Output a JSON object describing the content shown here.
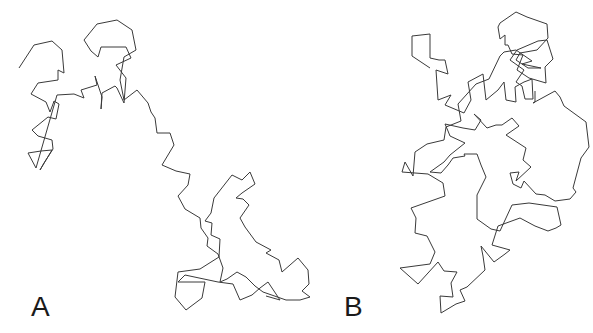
{
  "figure": {
    "panels": [
      {
        "label": "A",
        "description": "Protein C-alpha backbone trace, extended conformation"
      },
      {
        "label": "B",
        "description": "Protein C-alpha backbone trace, compact conformation"
      }
    ],
    "line_color": "#3a3a3a",
    "background": "#ffffff"
  },
  "traces": {
    "A": "19,68 34,45 52,41 62,50 64,73 58,70 58,80 38,83 31,94 46,102 50,112 53,104 54,101 59,104 56,119 48,117 32,130 38,136 52,140 53,149 44,163 40,170 52,150 41,151 28,153 36,168 57,95 74,94 84,98 81,90 97,85 95,76 102,97 101,109 102,93 115,86 117,88 124,103 126,78 116,65 131,58 126,47 101,47 98,57 91,51 84,40 97,24 117,20 132,30 136,50 124,57 120,80 124,100 137,90 148,103 151,112 155,118 157,133 170,133 174,145 162,165 176,171 190,174 188,185 178,196 185,209 200,218 201,228 208,238 207,246 218,254 223,268 220,282 227,279 237,272 246,277 255,286 263,292 286,300 300,300 310,297 302,291 309,284 308,270 298,258 282,272 279,260 266,253 271,250 256,242 245,227 240,218 249,205 243,199 236,198 242,193 255,184 250,172 242,180 232,175 214,198 211,213 205,221 212,223 211,235 220,239 219,257 200,269 178,272 175,297 186,310 202,298 205,282 178,282 185,275 218,282 233,284 240,300 252,295 260,288 268,282 280,300 266,296",
    "B": "430,68 412,56 412,36 430,34 430,58 439,60 445,60 448,74 436,70 438,100 451,95 445,105 464,113 471,100 468,82 483,74 486,100 498,90 504,82 506,100 516,102 515,87 524,82 532,79 533,99 525,99 522,86 516,82 524,70 510,60 517,50 538,41 547,40 553,59 545,67 546,83 529,78 517,70 523,55 512,54 508,45 505,45 505,35 500,39 498,27 500,23 516,12 527,17 547,24 548,38 537,50 520,53 516,60 528,68 541,68 522,64 532,61 516,50 504,52 500,56 489,79 476,84 458,104 461,121 446,127 444,140 427,144 415,152 413,176 405,162 402,172 428,174 443,183 445,196 411,208 416,218 415,233 427,236 435,252 430,264 400,268 418,284 438,262 444,271 457,272 451,283 453,297 440,296 441,313 456,304 465,301 460,290 467,287 485,270 483,256 481,246 494,262 505,254 510,250 492,245 498,226 520,218 535,226 548,231 556,228 561,225 557,207 529,203 512,205 500,231 491,229 477,219 477,195 486,177 481,165 477,154 464,154 465,156 453,158 448,165 441,173 430,172 444,162 450,155 465,143 450,136 448,131 445,124 463,128 475,130 481,120 474,114 487,128 496,125 502,125 512,118 519,126 506,135 526,148 525,152 523,160 531,167 516,181 519,172 510,173 513,184 521,188 524,181 536,194 545,195 555,201 570,199 576,192 573,188 581,158 589,147 586,122 564,106 560,97 555,91 533,103 535,102 535,91"
  }
}
